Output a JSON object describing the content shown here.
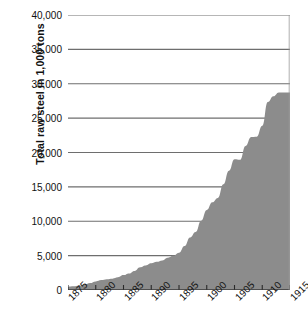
{
  "chart_data": {
    "type": "area",
    "title": "",
    "xlabel": "",
    "ylabel": "Total raw steel in 1,000 tons",
    "xlim": [
      1875,
      1915
    ],
    "ylim": [
      0,
      40000
    ],
    "grid": true,
    "legend": null,
    "y_ticks": [
      {
        "value": 40000,
        "label": "40,000"
      },
      {
        "value": 35000,
        "label": "35,000"
      },
      {
        "value": 30000,
        "label": "30,000"
      },
      {
        "value": 25000,
        "label": "25,000"
      },
      {
        "value": 20000,
        "label": "20,000"
      },
      {
        "value": 15000,
        "label": "15,000"
      },
      {
        "value": 10000,
        "label": "10,000"
      },
      {
        "value": 5000,
        "label": "5,000"
      },
      {
        "value": 0,
        "label": "0"
      }
    ],
    "x_ticks": [
      {
        "value": 1875,
        "label": "1875"
      },
      {
        "value": 1880,
        "label": "1880"
      },
      {
        "value": 1885,
        "label": "1885"
      },
      {
        "value": 1890,
        "label": "1890"
      },
      {
        "value": 1895,
        "label": "1895"
      },
      {
        "value": 1900,
        "label": "1900"
      },
      {
        "value": 1905,
        "label": "1905"
      },
      {
        "value": 1910,
        "label": "1910"
      },
      {
        "value": 1915,
        "label": "1915"
      }
    ],
    "series": [
      {
        "name": "Total raw steel",
        "fill_color": "#8c8c8c",
        "x": [
          1875,
          1876,
          1877,
          1878,
          1879,
          1880,
          1881,
          1882,
          1883,
          1884,
          1885,
          1886,
          1887,
          1888,
          1889,
          1890,
          1891,
          1892,
          1893,
          1894,
          1895,
          1896,
          1897,
          1898,
          1899,
          1900,
          1901,
          1902,
          1903,
          1904,
          1905,
          1906,
          1907,
          1908,
          1909,
          1910,
          1911,
          1912,
          1913
        ],
        "values": [
          380,
          530,
          560,
          730,
          935,
          1250,
          1590,
          1740,
          1670,
          1550,
          1710,
          2560,
          3340,
          2900,
          3390,
          4280,
          3900,
          4930,
          4020,
          4410,
          6210,
          5280,
          7160,
          8930,
          10640,
          10190,
          13470,
          14950,
          14530,
          13860,
          20020,
          23400,
          23360,
          14020,
          23950,
          26510,
          23680,
          31250,
          31300
        ],
        "y_axis_unit": "1,000 tons"
      }
    ]
  },
  "geometry": {
    "plot_left": 68,
    "plot_top": 15,
    "plot_width": 222,
    "plot_height": 275
  }
}
